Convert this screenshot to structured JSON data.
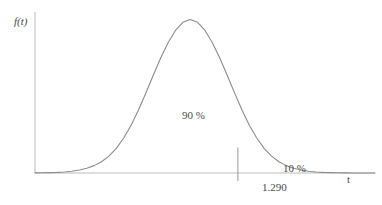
{
  "figure": {
    "background_color": "#ffffff",
    "curve_color": "#8a8a8a",
    "axis_color": "#b8b8b8",
    "text_color": "#4a4a4a",
    "width": 382,
    "height": 205
  },
  "labels": {
    "y_axis": "f(t)",
    "x_axis": "t",
    "main_area": "90 %",
    "tail_area": "10 %",
    "critical_value": "1.290"
  },
  "chart_data": {
    "type": "line",
    "title": "",
    "subtitle": "",
    "xlabel": "t",
    "ylabel": "f(t)",
    "grid": false,
    "legend": false,
    "legend_position": "none",
    "xlim": [
      -4.2,
      5.0
    ],
    "ylim": [
      0,
      0.42
    ],
    "annotations": [
      {
        "text": "90 %",
        "x": 0.0,
        "y": 0.155,
        "meaning": "area under curve to the left of the critical value"
      },
      {
        "text": "10 %",
        "x": 1.75,
        "y": 0.025,
        "meaning": "upper tail area to the right of the critical value"
      },
      {
        "text": "1.290",
        "x": 1.29,
        "y": -0.035,
        "meaning": "critical value tick label on t axis"
      }
    ],
    "vertical_lines": [
      {
        "x": 1.29,
        "y_top": 0.0735,
        "y_bottom": -0.02,
        "label": "1.290"
      }
    ],
    "series": [
      {
        "name": "t density",
        "x": [
          -4.2,
          -4.0,
          -3.8,
          -3.6,
          -3.4,
          -3.2,
          -3.0,
          -2.8,
          -2.6,
          -2.4,
          -2.2,
          -2.0,
          -1.8,
          -1.6,
          -1.4,
          -1.2,
          -1.0,
          -0.8,
          -0.6,
          -0.4,
          -0.2,
          0.0,
          0.2,
          0.4,
          0.6,
          0.8,
          1.0,
          1.2,
          1.29,
          1.4,
          1.6,
          1.8,
          2.0,
          2.2,
          2.4,
          2.6,
          2.8,
          3.0,
          3.2,
          3.4,
          3.6,
          3.8,
          4.0,
          4.2,
          4.4,
          4.6,
          4.8,
          5.0
        ],
        "y": [
          0.0004,
          0.0006,
          0.0011,
          0.0018,
          0.0031,
          0.0052,
          0.0085,
          0.0136,
          0.0213,
          0.0326,
          0.0488,
          0.0712,
          0.1009,
          0.1381,
          0.1821,
          0.2312,
          0.2823,
          0.3318,
          0.376,
          0.4114,
          0.435,
          0.4432,
          0.435,
          0.4114,
          0.376,
          0.3318,
          0.2823,
          0.2312,
          0.2095,
          0.1821,
          0.1381,
          0.1009,
          0.0712,
          0.0488,
          0.0326,
          0.0213,
          0.0136,
          0.0085,
          0.0052,
          0.0031,
          0.0018,
          0.0011,
          0.0006,
          0.0004,
          0.0002,
          0.0001,
          0.0001,
          0.0
        ]
      }
    ]
  }
}
